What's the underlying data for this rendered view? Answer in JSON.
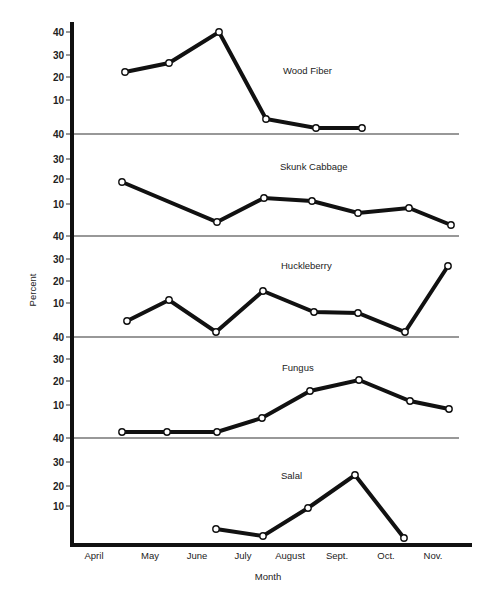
{
  "chart_data": {
    "type": "line",
    "title": "",
    "xlabel": "Month",
    "ylabel": "Percent",
    "categories": [
      "April",
      "May",
      "June",
      "July",
      "August",
      "Sept.",
      "Oct.",
      "Nov."
    ],
    "grid": false,
    "layout": "five stacked panels sharing a common month x-axis; each panel y-axis ticks 10,20,30,40",
    "yticks": [
      10,
      20,
      30,
      40
    ],
    "series": [
      {
        "name": "Wood Fiber",
        "x": [
          "late April",
          "mid May",
          "mid June",
          "early July",
          "August",
          "early Sept."
        ],
        "values": [
          22,
          26,
          40,
          5,
          1,
          1
        ]
      },
      {
        "name": "Skunk Cabbage",
        "x": [
          "late April",
          "mid June",
          "early July",
          "August",
          "early Sept.",
          "Oct.",
          "Nov."
        ],
        "values": [
          18,
          5,
          12,
          11,
          7,
          8,
          3
        ]
      },
      {
        "name": "Huckleberry",
        "x": [
          "late April",
          "mid May",
          "mid June",
          "early July",
          "August",
          "early Sept.",
          "Oct.",
          "Nov."
        ],
        "values": [
          5,
          11,
          1,
          15,
          8,
          7,
          1,
          27
        ]
      },
      {
        "name": "Fungus",
        "x": [
          "late April",
          "mid May",
          "mid June",
          "early July",
          "August",
          "early Sept.",
          "Oct.",
          "Nov."
        ],
        "values": [
          2,
          2,
          2,
          6,
          16,
          21,
          12,
          9
        ]
      },
      {
        "name": "Salal",
        "x": [
          "mid June",
          "early July",
          "August",
          "early Sept.",
          "Oct."
        ],
        "values": [
          4,
          1,
          9,
          24,
          0
        ]
      }
    ]
  },
  "render": {
    "yaxis_x": 72,
    "xaxis_y": 545,
    "month_label_x": [
      94,
      150,
      197,
      243,
      290,
      337,
      386,
      433
    ],
    "month_label_y": 559,
    "panels": [
      {
        "label_x": 283,
        "label_y": 74,
        "tick_y": {
          "40": 32,
          "30": 55,
          "20": 77,
          "10": 100
        },
        "divider_y": 134,
        "points": [
          [
            125,
            72
          ],
          [
            169,
            63
          ],
          [
            219,
            32
          ],
          [
            266,
            119
          ],
          [
            316,
            128
          ],
          [
            362,
            128
          ]
        ]
      },
      {
        "label_x": 280,
        "label_y": 170,
        "tick_y": {
          "40": 134,
          "30": 159,
          "20": 179,
          "10": 204
        },
        "divider_y": 236,
        "points": [
          [
            122,
            182
          ],
          [
            217,
            222
          ],
          [
            264,
            198
          ],
          [
            312,
            201
          ],
          [
            358,
            213
          ],
          [
            409,
            208
          ],
          [
            451,
            225
          ]
        ]
      },
      {
        "label_x": 281,
        "label_y": 269,
        "tick_y": {
          "40": 236,
          "30": 259,
          "20": 281,
          "10": 303
        },
        "divider_y": 337,
        "points": [
          [
            127,
            321
          ],
          [
            169,
            300
          ],
          [
            216,
            332
          ],
          [
            263,
            291
          ],
          [
            314,
            312
          ],
          [
            358,
            313
          ],
          [
            405,
            332
          ],
          [
            448,
            266
          ]
        ]
      },
      {
        "label_x": 282,
        "label_y": 371,
        "tick_y": {
          "40": 337,
          "30": 359,
          "20": 381,
          "10": 405
        },
        "divider_y": 438,
        "points": [
          [
            122,
            432
          ],
          [
            167,
            432
          ],
          [
            217,
            432
          ],
          [
            262,
            418
          ],
          [
            310,
            391
          ],
          [
            359,
            380
          ],
          [
            410,
            401
          ],
          [
            449,
            409
          ]
        ]
      },
      {
        "label_x": 281,
        "label_y": 479,
        "tick_y": {
          "40": 438,
          "30": 462,
          "20": 486,
          "10": 506
        },
        "divider_y": null,
        "points": [
          [
            216,
            529
          ],
          [
            263,
            536
          ],
          [
            308,
            508
          ],
          [
            355,
            475
          ],
          [
            404,
            538
          ]
        ]
      }
    ]
  }
}
